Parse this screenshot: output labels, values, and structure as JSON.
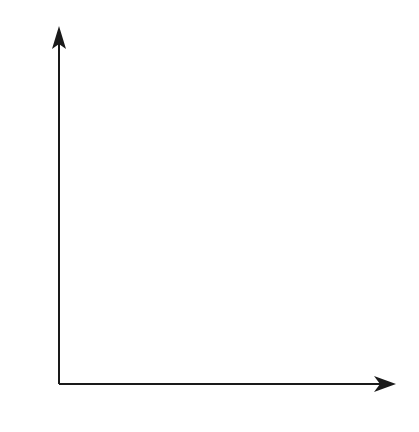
{
  "chart_data": {
    "type": "scatter",
    "title": "",
    "xlabel": "x",
    "ylabel": "z",
    "xlim": [
      0,
      6
    ],
    "ylim": [
      0,
      6
    ],
    "x_ticks": [
      "0",
      "1",
      "2",
      "3",
      "4",
      "5",
      "6"
    ],
    "y_ticks": [
      "0",
      "1",
      "2",
      "3",
      "4",
      "5",
      "6"
    ],
    "grid": true,
    "series": [],
    "colors": {
      "axis": "#1a1a1a",
      "grid": "#9a9a9a"
    }
  }
}
